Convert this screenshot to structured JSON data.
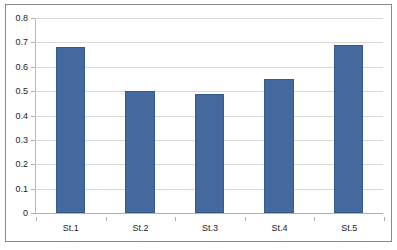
{
  "chart_data": {
    "type": "bar",
    "title": "",
    "subtitle": "",
    "xlabel": "",
    "ylabel": "",
    "categories": [
      "St.1",
      "St.2",
      "St.3",
      "St.4",
      "St.5"
    ],
    "values": [
      0.68,
      0.5,
      0.49,
      0.55,
      0.69
    ],
    "series": [
      {
        "name": "",
        "values": [
          0.68,
          0.5,
          0.49,
          0.55,
          0.69
        ]
      }
    ],
    "ylim": [
      0,
      0.8
    ],
    "yticks": [
      "0",
      "0.1",
      "0.2",
      "0.3",
      "0.4",
      "0.5",
      "0.6",
      "0.7",
      "0.8"
    ],
    "ytick_values": [
      0,
      0.1,
      0.2,
      0.3,
      0.4,
      0.5,
      0.6,
      0.7,
      0.8
    ],
    "grid": true,
    "grid_axis": "y",
    "legend": false,
    "legend_position": "none",
    "bar_color": "#43699f",
    "bar_border_color": "#365a8c",
    "gridline_color": "#d9d9d2",
    "axis_color": "#b0b0a8",
    "plot_background": "#ffffff",
    "frame_border_color": "#8a8a80",
    "label_color": "#1c1c1c"
  }
}
